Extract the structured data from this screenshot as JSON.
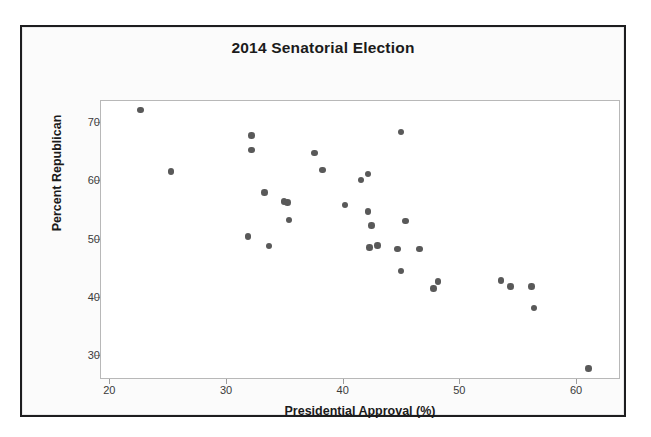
{
  "figure": {
    "title": "2014 Senatorial Election",
    "dot_color": "#595959",
    "frame_color": "#1d1d1f",
    "panel_border_color": "#b8b8b8"
  },
  "chart_data": {
    "type": "scatter",
    "title": "2014 Senatorial Election",
    "xlabel": "Presidential Approval (%)",
    "ylabel": "Percent Republican",
    "xlim": [
      19.2,
      63.6
    ],
    "ylim": [
      26.3,
      73.7
    ],
    "xticks": [
      20,
      30,
      40,
      50,
      60
    ],
    "yticks": [
      30,
      40,
      50,
      60,
      70
    ],
    "xtick_labels": [
      "20",
      "30",
      "40",
      "50",
      "60"
    ],
    "ytick_labels": [
      "30",
      "40",
      "50",
      "60",
      "70"
    ],
    "grid": false,
    "legend": null,
    "series": [
      {
        "name": "States",
        "marker": "circle",
        "color": "#595959",
        "points": [
          [
            22.6,
            72.2
          ],
          [
            25.2,
            61.6
          ],
          [
            31.8,
            50.5
          ],
          [
            32.1,
            67.8
          ],
          [
            32.1,
            65.3
          ],
          [
            33.2,
            58.0
          ],
          [
            33.6,
            48.9
          ],
          [
            34.9,
            56.5
          ],
          [
            35.2,
            56.3
          ],
          [
            35.3,
            53.3
          ],
          [
            37.5,
            64.8
          ],
          [
            38.2,
            61.9
          ],
          [
            40.1,
            55.9
          ],
          [
            41.5,
            60.2
          ],
          [
            42.1,
            61.2
          ],
          [
            42.1,
            54.8
          ],
          [
            42.2,
            48.6
          ],
          [
            42.4,
            52.4
          ],
          [
            42.9,
            49.0
          ],
          [
            44.6,
            48.4
          ],
          [
            44.9,
            68.4
          ],
          [
            44.9,
            44.6
          ],
          [
            45.3,
            53.2
          ],
          [
            46.5,
            48.4
          ],
          [
            47.7,
            41.6
          ],
          [
            48.1,
            42.8
          ],
          [
            53.5,
            43.0
          ],
          [
            54.3,
            42.0
          ],
          [
            56.1,
            42.0
          ],
          [
            56.3,
            38.3
          ],
          [
            61.0,
            27.9
          ]
        ]
      }
    ]
  }
}
